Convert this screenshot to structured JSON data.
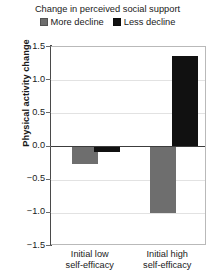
{
  "chart_data": {
    "type": "bar",
    "title": "Change in perceived social support",
    "xlabel": "",
    "ylabel": "Physical activity change",
    "categories": [
      "Initial low self-efficacy",
      "Initial high self-efficacy"
    ],
    "category_lines": [
      [
        "Initial low",
        "self-efficacy"
      ],
      [
        "Initial high",
        "self-efficacy"
      ]
    ],
    "series": [
      {
        "name": "More decline",
        "color": "#6e6e6e",
        "values": [
          -0.26,
          -1.0
        ]
      },
      {
        "name": "Less decline",
        "color": "#111111",
        "values": [
          -0.09,
          1.37
        ]
      }
    ],
    "ylim": [
      -1.5,
      1.5
    ],
    "yticks": [
      1.5,
      1.0,
      0.5,
      0.0,
      -0.5,
      -1.0,
      -1.5
    ],
    "ytick_labels": [
      "1.5",
      "1.0",
      "0.5",
      "0.0",
      "-0.5",
      "-1.0",
      "-1.5"
    ],
    "grid": true,
    "legend_position": "top",
    "zero_line": 0.0
  },
  "legend": {
    "items": [
      {
        "label": "More decline",
        "color": "#6e6e6e"
      },
      {
        "label": "Less decline",
        "color": "#111111"
      }
    ]
  }
}
